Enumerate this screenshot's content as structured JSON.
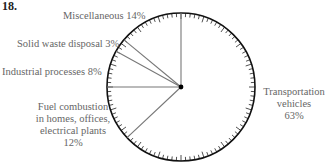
{
  "problem_number": "18.",
  "chart_data": {
    "type": "pie",
    "title": "",
    "start": "top",
    "direction": "clockwise",
    "slices": [
      {
        "label": "Transportation vehicles",
        "lines": [
          "Transportation",
          "vehicles",
          "63%"
        ],
        "value": 63
      },
      {
        "label": "Fuel combustion in homes, offices, electrical plants",
        "lines": [
          "Fuel combustion",
          "in homes, offices,",
          "electrical plants",
          "12%"
        ],
        "value": 12
      },
      {
        "label": "Industrial processes",
        "lines": [
          "Industrial processes 8%"
        ],
        "value": 8
      },
      {
        "label": "Solid waste disposal",
        "lines": [
          "Solid waste disposal 3%"
        ],
        "value": 3
      },
      {
        "label": "Miscellaneous",
        "lines": [
          "Miscellaneous 14%"
        ],
        "value": 14
      }
    ],
    "ticks": 100,
    "colors": {
      "stroke": "#111111",
      "divider": "#777777",
      "text": "#666666"
    }
  }
}
